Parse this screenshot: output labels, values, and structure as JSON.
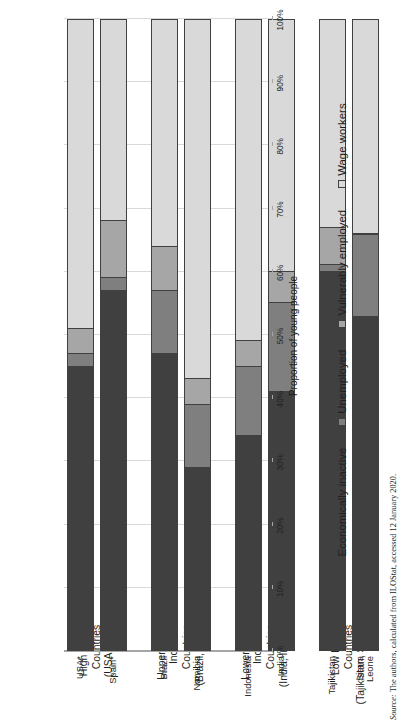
{
  "figure": {
    "axis_title": "Proportion of young people",
    "source_prefix": "Source:",
    "source_text": " The authors, calculated from ILOStat, accessed 12 January 2020."
  },
  "groups": [
    {
      "line1": "High Income",
      "line2": "Countries",
      "line3": "(USA, Spain)"
    },
    {
      "line1": "Upper middle-",
      "line2": "Income",
      "line3": "Countries",
      "line4": "(Brazil, Namibia)"
    },
    {
      "line1": "Lower middle-",
      "line2": "Income",
      "line3": "Countries",
      "line4": "(India, Indonesia)"
    },
    {
      "line1": "Low Income",
      "line2": "Countries",
      "line3": "(Tajikistan, Sierra Leone)"
    }
  ],
  "legend": [
    {
      "label": "Economically inactive",
      "color": "#404040"
    },
    {
      "label": "Unemployed",
      "color": "#7f7f7f"
    },
    {
      "label": "Vulnerably employed",
      "color": "#a6a6a6"
    },
    {
      "label": "Wage workers",
      "color": "#d9d9d9"
    }
  ],
  "yticks": [
    "0%",
    "10%",
    "20%",
    "30%",
    "40%",
    "50%",
    "60%",
    "70%",
    "80%",
    "90%",
    "100%"
  ],
  "chart_data": {
    "type": "bar",
    "title": "",
    "subtitle": "",
    "orientation": "vertical-stacked",
    "stacked": true,
    "normalized": true,
    "xlabel": "",
    "ylabel": "Proportion of young people",
    "ylim": [
      0,
      100
    ],
    "ytick_step": 10,
    "grid": "y-gridlines-only",
    "legend_position": "bottom-center",
    "categories": [
      "USA*",
      "Spain*",
      "Brazil",
      "Namibia",
      "Indonesia",
      "India",
      "Tajikistan",
      "Sierra Leone"
    ],
    "category_groups": [
      {
        "name": "High Income Countries (USA, Spain)",
        "categories": [
          "USA*",
          "Spain*"
        ]
      },
      {
        "name": "Upper middle-Income Countries (Brazil, Namibia)",
        "categories": [
          "Brazil",
          "Namibia"
        ]
      },
      {
        "name": "Lower middle-Income Countries (India, Indonesia)",
        "categories": [
          "Indonesia",
          "India"
        ]
      },
      {
        "name": "Low Income Countries (Tajikistan, Sierra Leone)",
        "categories": [
          "Tajikistan",
          "Sierra Leone"
        ]
      }
    ],
    "series": [
      {
        "name": "Wage workers",
        "color": "#404040",
        "values": [
          45,
          57,
          47,
          29,
          34,
          41,
          60,
          53
        ]
      },
      {
        "name": "Vulnerably employed",
        "color": "#7f7f7f",
        "values": [
          2,
          2,
          10,
          10,
          11,
          14,
          1,
          13
        ]
      },
      {
        "name": "Unemployed",
        "color": "#a6a6a6",
        "values": [
          4,
          9,
          7,
          4,
          4,
          5,
          6,
          0
        ]
      },
      {
        "name": "Economically inactive",
        "color": "#d9d9d9",
        "values": [
          49,
          32,
          36,
          57,
          51,
          40,
          33,
          34
        ]
      }
    ],
    "note": "Each bar sums to 100%. Reading order in each bar from 0% upward: Wage workers, Vulnerably employed, Unemployed, Economically inactive."
  }
}
